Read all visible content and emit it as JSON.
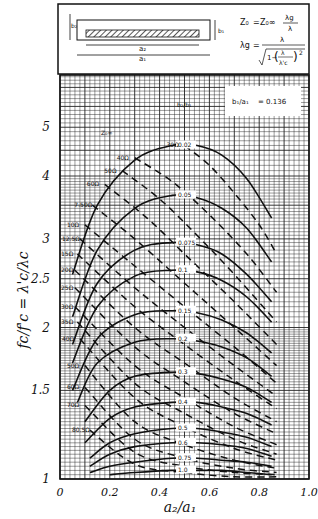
{
  "header": {
    "diagram_labels": {
      "b2": "b₂",
      "b1": "b₁",
      "a2": "a₂",
      "a1": "a₁"
    },
    "formula1": {
      "lhs": "Z₀",
      "eq": "=",
      "rhs": "Z₀∞",
      "num": "λg",
      "den": "λ"
    },
    "formula2": {
      "lhs": "λg",
      "eq": "=",
      "num": "λ",
      "den_prefix": "1−",
      "inner_num": "λ",
      "inner_den": "λ'c",
      "exp": "2"
    }
  },
  "annotation": {
    "ratio_label": "b₁/a₁",
    "ratio_value": "= 0.136",
    "b_ratio_label": "b₂/b₁",
    "z_label": "Z₀∞"
  },
  "chart_data": {
    "type": "line",
    "title": "",
    "xlabel": "a₂/a₁",
    "ylabel": "fc/f'c = λ'c/λc",
    "xlim": [
      0,
      1.0
    ],
    "ylim": [
      1,
      6.35
    ],
    "yscale": "log",
    "grid": true,
    "xticks": [
      "0",
      "0.2",
      "0.4",
      "0.6",
      "0.8",
      "1.0"
    ],
    "xtick_values": [
      0,
      0.2,
      0.4,
      0.6,
      0.8,
      1.0
    ],
    "yticks": [
      "1",
      "1.5",
      "2",
      "2.5",
      "3",
      "4",
      "5"
    ],
    "ytick_values": [
      1,
      1.5,
      2,
      2.5,
      3,
      4,
      5
    ],
    "solid_series_param": "b2/b1",
    "solid_series": [
      {
        "name": "0.02",
        "x": [
          0.05,
          0.15,
          0.3,
          0.45,
          0.55,
          0.65,
          0.75,
          0.85
        ],
        "y": [
          2.55,
          3.5,
          4.3,
          4.6,
          4.6,
          4.4,
          3.95,
          3.3
        ]
      },
      {
        "name": "0.05",
        "x": [
          0.05,
          0.15,
          0.3,
          0.45,
          0.55,
          0.65,
          0.75,
          0.85
        ],
        "y": [
          2.1,
          2.85,
          3.45,
          3.66,
          3.62,
          3.45,
          3.15,
          2.7
        ]
      },
      {
        "name": "0.075",
        "x": [
          0.05,
          0.15,
          0.3,
          0.45,
          0.55,
          0.65,
          0.75,
          0.85
        ],
        "y": [
          1.85,
          2.45,
          2.85,
          2.95,
          2.92,
          2.8,
          2.55,
          2.25
        ]
      },
      {
        "name": "0.1",
        "x": [
          0.05,
          0.15,
          0.3,
          0.45,
          0.55,
          0.65,
          0.75,
          0.85
        ],
        "y": [
          1.7,
          2.2,
          2.53,
          2.6,
          2.58,
          2.48,
          2.3,
          2.05
        ]
      },
      {
        "name": "0.15",
        "x": [
          0.05,
          0.15,
          0.3,
          0.45,
          0.55,
          0.65,
          0.75,
          0.85
        ],
        "y": [
          1.5,
          1.9,
          2.12,
          2.16,
          2.14,
          2.07,
          1.95,
          1.78
        ]
      },
      {
        "name": "0.2",
        "x": [
          0.07,
          0.15,
          0.3,
          0.45,
          0.55,
          0.65,
          0.75,
          0.85
        ],
        "y": [
          1.42,
          1.7,
          1.87,
          1.9,
          1.88,
          1.83,
          1.74,
          1.6
        ]
      },
      {
        "name": "0.3",
        "x": [
          0.1,
          0.2,
          0.3,
          0.45,
          0.55,
          0.65,
          0.75,
          0.85
        ],
        "y": [
          1.3,
          1.5,
          1.6,
          1.63,
          1.62,
          1.58,
          1.52,
          1.42
        ]
      },
      {
        "name": "0.4",
        "x": [
          0.1,
          0.2,
          0.3,
          0.45,
          0.55,
          0.65,
          0.75,
          0.85
        ],
        "y": [
          1.18,
          1.32,
          1.39,
          1.42,
          1.42,
          1.39,
          1.35,
          1.28
        ]
      },
      {
        "name": "0.5",
        "x": [
          0.12,
          0.2,
          0.3,
          0.45,
          0.55,
          0.65,
          0.75,
          0.85
        ],
        "y": [
          1.1,
          1.18,
          1.23,
          1.26,
          1.26,
          1.24,
          1.21,
          1.16
        ]
      },
      {
        "name": "0.6",
        "x": [
          0.12,
          0.2,
          0.3,
          0.45,
          0.55,
          0.65,
          0.75,
          0.85
        ],
        "y": [
          1.06,
          1.12,
          1.16,
          1.18,
          1.18,
          1.17,
          1.15,
          1.11
        ]
      },
      {
        "name": "0.75",
        "x": [
          0.12,
          0.2,
          0.3,
          0.45,
          0.55,
          0.65,
          0.75,
          0.85
        ],
        "y": [
          1.03,
          1.06,
          1.08,
          1.1,
          1.1,
          1.09,
          1.08,
          1.06
        ]
      },
      {
        "name": "1.0",
        "x": [
          0.2,
          0.3,
          0.45,
          0.55,
          0.65,
          0.75,
          0.85
        ],
        "y": [
          1.02,
          1.03,
          1.04,
          1.04,
          1.04,
          1.03,
          1.02
        ]
      }
    ],
    "dashed_series_param": "Z0∞ (ohms)",
    "dashed_series": [
      {
        "name": "30Ω",
        "x": [
          0.5,
          0.6,
          0.7,
          0.8,
          0.87
        ],
        "y": [
          4.6,
          4.2,
          3.7,
          3.2,
          2.8
        ]
      },
      {
        "name": "40Ω",
        "x": [
          0.3,
          0.45,
          0.6,
          0.75,
          0.87
        ],
        "y": [
          4.35,
          3.9,
          3.35,
          2.8,
          2.35
        ]
      },
      {
        "name": "50Ω",
        "x": [
          0.25,
          0.4,
          0.55,
          0.7,
          0.87
        ],
        "y": [
          4.1,
          3.6,
          3.05,
          2.55,
          2.05
        ]
      },
      {
        "name": "60Ω",
        "x": [
          0.18,
          0.35,
          0.5,
          0.7,
          0.87
        ],
        "y": [
          3.85,
          3.3,
          2.8,
          2.25,
          1.85
        ]
      },
      {
        "name": "7.50Ω",
        "x": [
          0.13,
          0.3,
          0.5,
          0.7,
          0.87
        ],
        "y": [
          3.5,
          3.0,
          2.45,
          2.0,
          1.68
        ]
      },
      {
        "name": "10Ω",
        "x": [
          0.1,
          0.3,
          0.5,
          0.7,
          0.87
        ],
        "y": [
          3.2,
          2.65,
          2.2,
          1.83,
          1.55
        ]
      },
      {
        "name": "12.5Ω",
        "x": [
          0.08,
          0.3,
          0.5,
          0.7,
          0.87
        ],
        "y": [
          3.0,
          2.4,
          2.0,
          1.68,
          1.46
        ]
      },
      {
        "name": "15Ω",
        "x": [
          0.07,
          0.3,
          0.5,
          0.7,
          0.87
        ],
        "y": [
          2.8,
          2.2,
          1.85,
          1.57,
          1.38
        ]
      },
      {
        "name": "20Ω",
        "x": [
          0.06,
          0.3,
          0.5,
          0.7,
          0.87
        ],
        "y": [
          2.6,
          2.0,
          1.7,
          1.45,
          1.3
        ]
      },
      {
        "name": "25Ω",
        "x": [
          0.06,
          0.3,
          0.5,
          0.7,
          0.87
        ],
        "y": [
          2.4,
          1.83,
          1.56,
          1.35,
          1.23
        ]
      },
      {
        "name": "30Ω",
        "x": [
          0.06,
          0.3,
          0.5,
          0.7,
          0.87
        ],
        "y": [
          2.2,
          1.68,
          1.45,
          1.27,
          1.17
        ]
      },
      {
        "name": "35Ω",
        "x": [
          0.07,
          0.3,
          0.5,
          0.7,
          0.87
        ],
        "y": [
          2.05,
          1.55,
          1.35,
          1.2,
          1.12
        ]
      },
      {
        "name": "40Ω",
        "x": [
          0.08,
          0.3,
          0.5,
          0.7,
          0.87
        ],
        "y": [
          1.9,
          1.45,
          1.27,
          1.15,
          1.09
        ]
      },
      {
        "name": "50Ω",
        "x": [
          0.1,
          0.3,
          0.5,
          0.7,
          0.87
        ],
        "y": [
          1.68,
          1.3,
          1.17,
          1.09,
          1.05
        ]
      },
      {
        "name": "60Ω",
        "x": [
          0.1,
          0.3,
          0.5,
          0.7,
          0.87
        ],
        "y": [
          1.52,
          1.2,
          1.1,
          1.05,
          1.03
        ]
      },
      {
        "name": "70Ω",
        "x": [
          0.1,
          0.3,
          0.5,
          0.7,
          0.87
        ],
        "y": [
          1.4,
          1.13,
          1.06,
          1.03,
          1.02
        ]
      },
      {
        "name": "80.5Ω",
        "x": [
          0.12,
          0.3,
          0.5,
          0.7,
          0.87
        ],
        "y": [
          1.25,
          1.07,
          1.03,
          1.01,
          1.01
        ]
      }
    ],
    "z_labels": [
      "40Ω",
      "5Ω",
      "6Ω",
      "7.5Ω",
      "10Ω",
      "12.5Ω",
      "15Ω",
      "20Ω",
      "25Ω",
      "30Ω",
      "35Ω",
      "40Ω",
      "50Ω",
      "60Ω",
      "70Ω",
      "80.5Ω",
      "3Ω"
    ],
    "annotations": [
      "b1/a1 = 0.136",
      "b2/b1",
      "Z0∞"
    ]
  }
}
